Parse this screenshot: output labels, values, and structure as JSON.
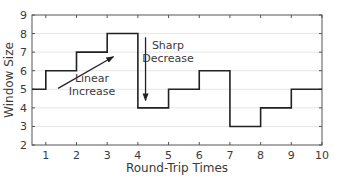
{
  "chart_data": {
    "type": "line",
    "style": "step",
    "title": "",
    "xlabel": "Round-Trip Times",
    "ylabel": "Window Size",
    "xlim": [
      0.55,
      10
    ],
    "ylim": [
      2,
      9
    ],
    "xticks": [
      1,
      2,
      3,
      4,
      5,
      6,
      7,
      8,
      9,
      10
    ],
    "yticks": [
      2,
      3,
      4,
      5,
      6,
      7,
      8,
      9
    ],
    "grid": true,
    "legend": null,
    "series": [
      {
        "name": "Window Size",
        "color": "#222222",
        "steps": [
          {
            "x_start": 0.55,
            "x_end": 1,
            "y": 5
          },
          {
            "x_start": 1,
            "x_end": 2,
            "y": 6
          },
          {
            "x_start": 2,
            "x_end": 3,
            "y": 7
          },
          {
            "x_start": 3,
            "x_end": 4,
            "y": 8
          },
          {
            "x_start": 4,
            "x_end": 5,
            "y": 4
          },
          {
            "x_start": 5,
            "x_end": 6,
            "y": 5
          },
          {
            "x_start": 6,
            "x_end": 7,
            "y": 6
          },
          {
            "x_start": 7,
            "x_end": 8,
            "y": 3
          },
          {
            "x_start": 8,
            "x_end": 9,
            "y": 4
          },
          {
            "x_start": 9,
            "x_end": 10,
            "y": 5
          }
        ]
      }
    ],
    "annotations": [
      {
        "text": [
          "Linear",
          "Increase"
        ],
        "arrow": {
          "from": [
            1.4,
            5.05
          ],
          "to": [
            3.2,
            6.75
          ]
        }
      },
      {
        "text": [
          "Sharp",
          "Decrease"
        ],
        "arrow": {
          "from": [
            4.25,
            7.8
          ],
          "to": [
            4.25,
            4.4
          ]
        }
      }
    ]
  }
}
